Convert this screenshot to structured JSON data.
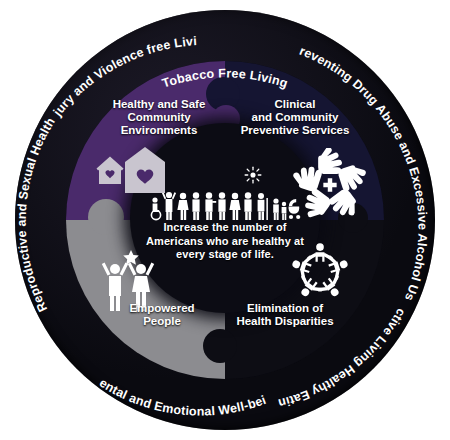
{
  "graphic": {
    "title": "National Prevention Strategy wheel",
    "center": {
      "mission": "Increase the number of Americans who are healthy at every stage of life.",
      "people_icon": "diverse-people-row-icon",
      "sun_icon": "sun-icon"
    },
    "quadrants": [
      {
        "id": "healthy-safe-community-environments",
        "label": "Healthy and Safe\nCommunity\nEnvironments",
        "label_lines": [
          "Healthy and Safe",
          "Community",
          "Environments"
        ],
        "color": "#4a2a6b",
        "icon": "houses-with-heart-icon"
      },
      {
        "id": "clinical-and-community-preventive-services",
        "label": "Clinical\nand Community\nPreventive Services",
        "label_lines": [
          "Clinical",
          "and Community",
          "Preventive Services"
        ],
        "color": "#151532",
        "icon": "hands-circle-cross-icon"
      },
      {
        "id": "empowered-people",
        "label": "Empowered\nPeople",
        "label_lines": [
          "Empowered",
          "People"
        ],
        "color": "#8c8c90",
        "icon": "two-people-celebrating-star-icon"
      },
      {
        "id": "elimination-of-health-disparities",
        "label": "Elimination of\nHealth Disparities",
        "label_lines": [
          "Elimination of",
          "Health Disparities"
        ],
        "color": "#0d0d14",
        "icon": "people-holding-hands-circle-icon"
      }
    ],
    "ring_labels": [
      {
        "id": "tobacco-free-living",
        "text": "Tobacco Free Living"
      },
      {
        "id": "preventing-drug-abuse",
        "text": "Preventing Drug Abuse and Excessive Alcohol Use"
      },
      {
        "id": "active-living-healthy-eating",
        "text": "Active Living Healthy Eating"
      },
      {
        "id": "mental-and-emotional-well-being",
        "text": "Mental and Emotional Well-being"
      },
      {
        "id": "reproductive-and-sexual-health",
        "text": "Reproductive and Sexual Health"
      },
      {
        "id": "injury-and-violence-free-living",
        "text": "Injury and Violence free Living"
      }
    ],
    "colors": {
      "ring": "#0a0a10",
      "background": "#ffffff",
      "text": "#ffffff",
      "purple": "#4a2a6b",
      "navy": "#151532",
      "gray": "#8c8c90",
      "black": "#0d0d14"
    }
  }
}
